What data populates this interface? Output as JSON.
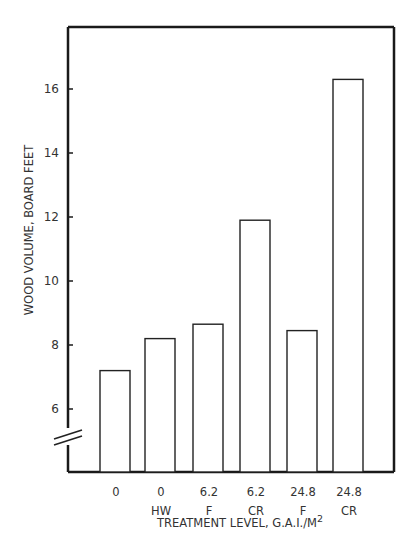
{
  "chart_data": {
    "type": "bar",
    "title": "",
    "xlabel": "TREATMENT LEVEL, G.A.I./M",
    "xlabel_superscript": "2",
    "ylabel": "WOOD VOLUME, BOARD FEET",
    "categories": [
      {
        "line1": "0",
        "line2": ""
      },
      {
        "line1": "0",
        "line2": "HW"
      },
      {
        "line1": "6.2",
        "line2": "F"
      },
      {
        "line1": "6.2",
        "line2": "CR"
      },
      {
        "line1": "24.8",
        "line2": "F"
      },
      {
        "line1": "24.8",
        "line2": "CR"
      }
    ],
    "values": [
      7.2,
      8.2,
      8.65,
      11.9,
      8.45,
      16.3
    ],
    "yticks": [
      6,
      8,
      10,
      12,
      14,
      16
    ],
    "ylim": [
      4.2,
      17.9
    ],
    "y_axis_break": true,
    "grid": false,
    "legend": null,
    "bar_fill": "#ffffff",
    "bar_stroke": "#222222"
  }
}
